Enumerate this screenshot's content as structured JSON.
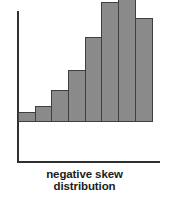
{
  "figure": {
    "background_color": "#ffffff",
    "width": 169,
    "height": 206
  },
  "caption": {
    "line1": "negative skew",
    "line2": "distribution"
  },
  "colors": {
    "bar_fill": "#8a8a8a",
    "bar_outline": "#3f3f3f",
    "axis": "#2f2f2f",
    "caption_text": "#1c1c1c"
  },
  "chart_data": {
    "type": "bar",
    "title": "negative skew distribution",
    "subtitle": "",
    "xlabel": "",
    "ylabel": "",
    "categories": [
      "1",
      "2",
      "3",
      "4",
      "5",
      "6",
      "7",
      "8"
    ],
    "values": [
      10,
      16,
      32,
      52,
      85,
      120,
      138,
      104
    ],
    "ylim": [
      0,
      140
    ],
    "grid": false,
    "legend": false,
    "axes_shown": [
      "y-axis",
      "x-axis-baseline"
    ],
    "tick_labels": {
      "x": [],
      "y": []
    },
    "annotations": [
      "negative skew distribution"
    ],
    "series": [
      {
        "name": "frequency",
        "values": [
          10,
          16,
          32,
          52,
          85,
          120,
          138,
          104
        ]
      }
    ]
  }
}
